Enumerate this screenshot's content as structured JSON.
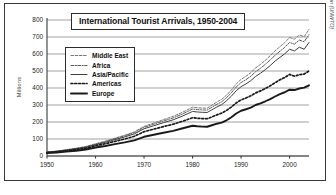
{
  "chart_data": {
    "type": "line",
    "title": "International Tourist Arrivals, 1950-2004",
    "xlabel": "",
    "ylabel": "Millions",
    "source": "UN World Tourism Organization (UNWTO)",
    "xlim": [
      1950,
      2004
    ],
    "ylim": [
      0,
      800
    ],
    "yticks": [
      0,
      100,
      200,
      300,
      400,
      500,
      600,
      700,
      800
    ],
    "xticks": [
      1950,
      1960,
      1970,
      1980,
      1990,
      2000
    ],
    "grid": "horizontal",
    "legend_position": "upper-left-inset",
    "x": [
      1950,
      1952,
      1954,
      1956,
      1958,
      1960,
      1962,
      1964,
      1966,
      1968,
      1970,
      1972,
      1974,
      1976,
      1978,
      1980,
      1981,
      1982,
      1983,
      1984,
      1985,
      1986,
      1987,
      1988,
      1989,
      1990,
      1991,
      1992,
      1993,
      1994,
      1995,
      1996,
      1997,
      1998,
      1999,
      2000,
      2001,
      2002,
      2003,
      2004
    ],
    "series": [
      {
        "name": "Europe",
        "style": "solid-thick",
        "color": "#1a1a1a",
        "values": [
          17,
          21,
          26,
          31,
          38,
          50,
          59,
          70,
          80,
          92,
          113,
          125,
          137,
          148,
          163,
          178,
          175,
          173,
          172,
          181,
          190,
          196,
          210,
          228,
          250,
          266,
          275,
          285,
          300,
          310,
          322,
          335,
          350,
          364,
          375,
          390,
          388,
          397,
          402,
          416
        ]
      },
      {
        "name": "Americas",
        "style": "dotted-bold",
        "color": "#1a1a1a",
        "values": [
          20,
          25,
          31,
          38,
          46,
          60,
          72,
          86,
          100,
          116,
          143,
          158,
          173,
          187,
          205,
          225,
          222,
          220,
          219,
          230,
          242,
          252,
          268,
          288,
          312,
          330,
          341,
          354,
          371,
          383,
          397,
          413,
          431,
          448,
          462,
          480,
          470,
          478,
          482,
          500
        ]
      },
      {
        "name": "Asia/Pacific",
        "style": "solid-thin",
        "color": "#3f3f3f",
        "values": [
          22,
          27,
          34,
          42,
          51,
          66,
          80,
          96,
          112,
          130,
          160,
          178,
          196,
          213,
          236,
          262,
          259,
          257,
          256,
          272,
          288,
          302,
          325,
          352,
          384,
          408,
          424,
          443,
          468,
          487,
          508,
          532,
          558,
          580,
          601,
          628,
          618,
          640,
          628,
          668
        ]
      },
      {
        "name": "Africa",
        "style": "dash-dot",
        "color": "#5a5a5a",
        "values": [
          23,
          28,
          36,
          44,
          54,
          69,
          84,
          101,
          118,
          137,
          168,
          187,
          206,
          224,
          248,
          276,
          273,
          271,
          270,
          287,
          304,
          319,
          343,
          372,
          406,
          432,
          449,
          469,
          496,
          516,
          539,
          565,
          592,
          616,
          639,
          668,
          658,
          682,
          672,
          714
        ]
      },
      {
        "name": "Middle East",
        "style": "dashed-light",
        "color": "#777777",
        "values": [
          24,
          29,
          37,
          46,
          56,
          72,
          87,
          105,
          122,
          142,
          174,
          194,
          214,
          233,
          258,
          287,
          284,
          282,
          281,
          299,
          317,
          333,
          358,
          388,
          424,
          451,
          469,
          490,
          518,
          539,
          563,
          590,
          618,
          643,
          667,
          697,
          687,
          712,
          702,
          745
        ]
      }
    ]
  }
}
